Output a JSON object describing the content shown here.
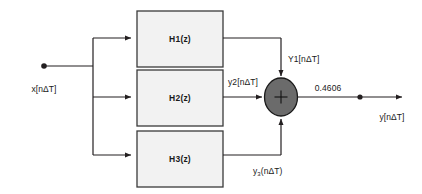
{
  "diagram": {
    "type": "signal-flow-block-diagram",
    "background_color": "#ffffff",
    "line_color": "#231f20",
    "block_fill_color": "#f2f2f2",
    "block_border_color": "#3a3a3a",
    "summing_node_fill": "#6b6b6b",
    "summing_node_border": "#1a1a1a",
    "input": {
      "label": "x[nΔT]",
      "node_type": "dot"
    },
    "blocks": [
      {
        "id": "h1",
        "label": "H1(z)"
      },
      {
        "id": "h2",
        "label": "H2(z)"
      },
      {
        "id": "h3",
        "label": "H3(z)"
      }
    ],
    "branch_labels": [
      {
        "id": "y1",
        "label": "Y1[nΔT]"
      },
      {
        "id": "y2",
        "label": "y2[nΔT]"
      },
      {
        "id": "y3",
        "label": "y",
        "sub": "3",
        "label_tail": "(nΔT)"
      }
    ],
    "summing_node": {
      "operator": "+"
    },
    "gain": {
      "value": "0.4606"
    },
    "output": {
      "label": "y[nΔT]",
      "node_type": "dot"
    }
  }
}
